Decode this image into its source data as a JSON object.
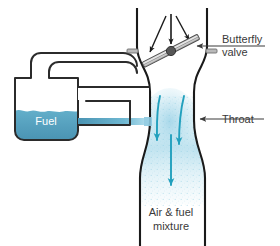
{
  "figure": {
    "background_color": "#ffffff"
  },
  "colors": {
    "outline": "#1a1a1a",
    "fuel_liquid": "#5aa7c4",
    "fuel_liquid_dark": "#3f90ad",
    "flow_arrow": "#22a0bd",
    "mist": "#bfe3ef",
    "leader_line": "#3a3a3a",
    "text": "#3a3a3a",
    "text_on_fuel": "#ffffff",
    "valve_plate": "#9a9a9a",
    "valve_pivot": "#555555",
    "intake_arrow": "#1a1a1a"
  },
  "labels": {
    "butterfly_valve": {
      "line1": "Butterfly",
      "line2": "valve"
    },
    "throat": {
      "line1": "Throat"
    },
    "fuel": {
      "line1": "Fuel"
    },
    "air_fuel_mixture": {
      "line1": "Air & fuel",
      "line2": "mixture"
    }
  },
  "parts": [
    {
      "name": "float-bowl",
      "label": "Fuel"
    },
    {
      "name": "butterfly-valve",
      "label": "Butterfly valve"
    },
    {
      "name": "venturi-throat",
      "label": "Throat"
    },
    {
      "name": "outlet-pipe",
      "label": "Air & fuel mixture"
    }
  ],
  "flow_arrows": {
    "intake_count": 3,
    "throat_count": 3,
    "direction": "downward"
  }
}
